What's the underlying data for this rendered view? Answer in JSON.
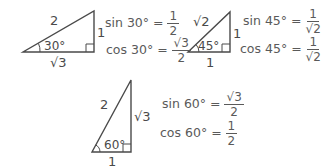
{
  "triangles": [
    {
      "id": "30-60-90",
      "hypotenuse": "2",
      "opposite": "1",
      "adjacent": "√3",
      "angle": "30°",
      "equations": [
        {
          "lhs": "sin 30° =",
          "num": "1",
          "den": "2"
        },
        {
          "lhs": "cos 30° =",
          "num": "√3",
          "den": "2"
        }
      ]
    },
    {
      "id": "45-45-90",
      "hypotenuse": "√2",
      "opposite": "1",
      "adjacent": "1",
      "angle": "45°",
      "equations": [
        {
          "lhs": "sin 45° =",
          "num": "1",
          "den": "√2"
        },
        {
          "lhs": "cos 45° =",
          "num": "1",
          "den": "√2"
        }
      ]
    },
    {
      "id": "60-30-90",
      "hypotenuse": "2",
      "opposite": "√3",
      "adjacent": "1",
      "angle": "60°",
      "equations": [
        {
          "lhs": "sin 60° =",
          "num": "√3",
          "den": "2"
        },
        {
          "lhs": "cos 60° =",
          "num": "1",
          "den": "2"
        }
      ]
    }
  ],
  "colors": {
    "stroke": "#4a4a4a",
    "text": "#4a4a4a"
  }
}
